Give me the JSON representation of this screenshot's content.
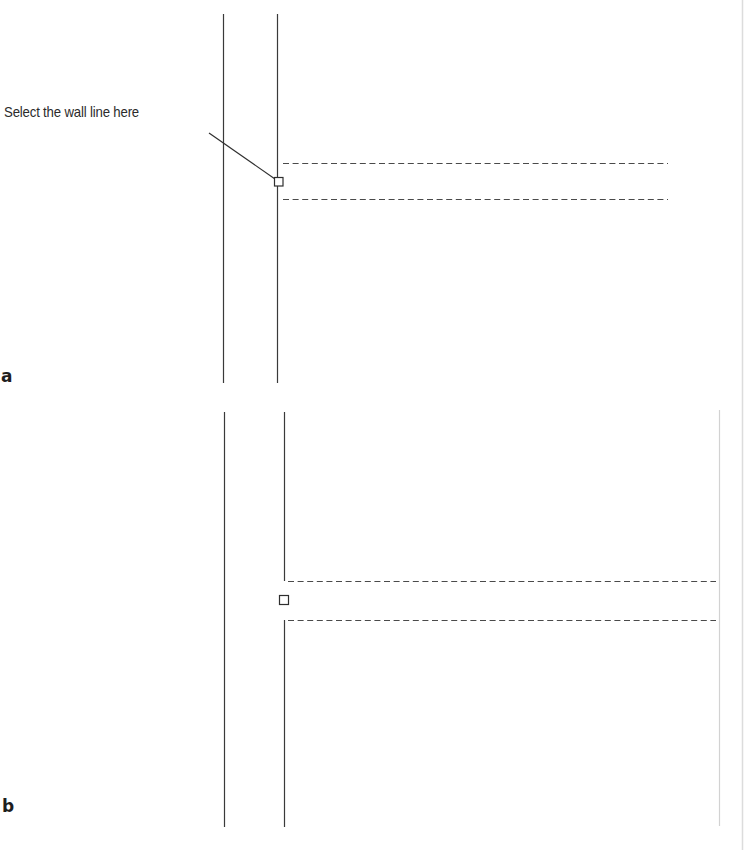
{
  "figure": {
    "callout": {
      "text": "Select the wall line here"
    },
    "panels": [
      {
        "label": "a",
        "description": "Wall lines with intersecting dashed wall, pick box on wall line"
      },
      {
        "label": "b",
        "description": "Wall line broken at intersection with dashed wall"
      }
    ]
  },
  "colors": {
    "line": "#3a3a3a",
    "dashed": "#4a4a4a",
    "faint": "#d6d6d6",
    "background": "#ffffff"
  }
}
